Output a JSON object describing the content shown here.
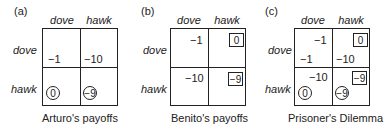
{
  "panels": [
    {
      "label": "(a)",
      "col_headers": [
        "dove",
        "hawk"
      ],
      "row_headers": [
        "dove",
        "hawk"
      ],
      "cells": {
        "dd_row": "−1",
        "dh_row": "−10",
        "hd_row": "0",
        "hh_row": "−9"
      },
      "caption": "Arturo's payoffs"
    },
    {
      "label": "(b)",
      "col_headers": [
        "dove",
        "hawk"
      ],
      "row_headers": [
        "dove",
        "hawk"
      ],
      "cells": {
        "dd_col": "−1",
        "dh_col": "0",
        "hd_col": "−10",
        "hh_col": "−9"
      },
      "caption": "Benito's payoffs"
    },
    {
      "label": "(c)",
      "col_headers": [
        "dove",
        "hawk"
      ],
      "row_headers": [
        "dove",
        "hawk"
      ],
      "cells": {
        "dd_col": "−1",
        "dd_row": "−1",
        "dh_col": "0",
        "dh_row": "−10",
        "hd_col": "−10",
        "hd_row": "0",
        "hh_col": "−9",
        "hh_row": "−9"
      },
      "caption": "Prisoner's Dilemma"
    }
  ],
  "legend": {
    "circled": "row player's best response",
    "boxed": "column player's best response"
  }
}
